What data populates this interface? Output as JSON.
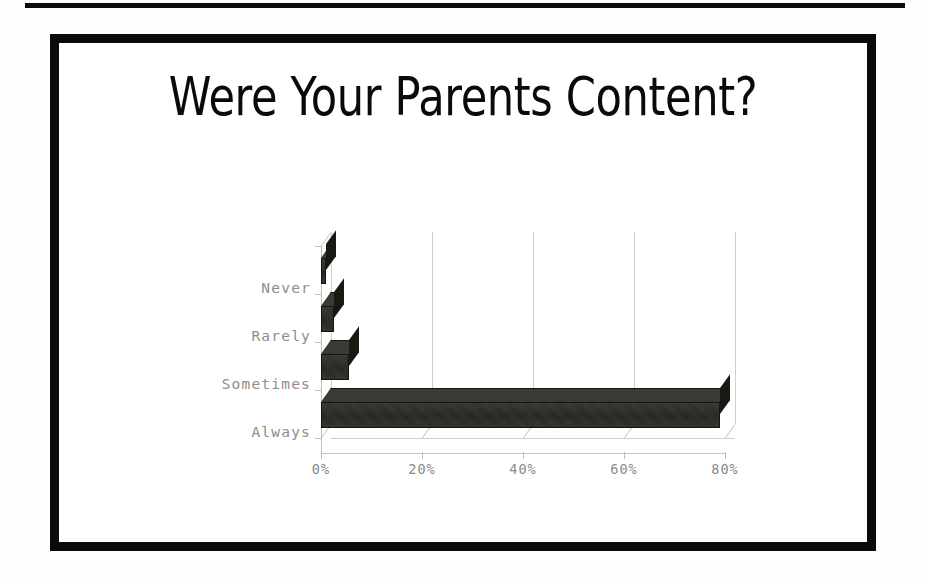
{
  "slide": {
    "title": "Were Your Parents Content?",
    "background_color": "#ffffff",
    "frame_color": "#0a0a0a"
  },
  "chart_data": {
    "type": "bar",
    "orientation": "horizontal",
    "style": "3d",
    "title": "Were Your Parents Content?",
    "categories": [
      "Never",
      "Rarely",
      "Sometimes",
      "Always"
    ],
    "values": [
      1,
      2.5,
      5.5,
      79
    ],
    "xlabel": "",
    "ylabel": "",
    "xlim": [
      0,
      80
    ],
    "xticks": [
      0,
      20,
      40,
      60,
      80
    ],
    "xtick_labels": [
      "0%",
      "20%",
      "40%",
      "60%",
      "80%"
    ],
    "grid": true,
    "legend": false,
    "bar_color": "#2b2b25",
    "axis_color": "#bdbdbd",
    "tick_label_color": "#8a8a8a"
  },
  "axis": {
    "tick_labels": [
      "0%",
      "20%",
      "40%",
      "60%",
      "80%"
    ],
    "category_labels": [
      "Never",
      "Rarely",
      "Sometimes",
      "Always"
    ]
  }
}
